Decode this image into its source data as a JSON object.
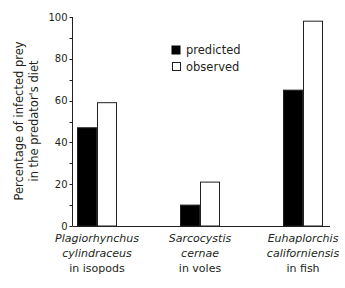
{
  "chart_data": {
    "type": "bar",
    "title": "",
    "xlabel": "",
    "ylabel": "Percentage of infected prey in the predator's diet",
    "ylabel_lines": [
      "Percentage of infected prey",
      "in the predator's diet"
    ],
    "ylim": [
      0,
      100
    ],
    "yticks": [
      0,
      20,
      40,
      60,
      80,
      100
    ],
    "grid": false,
    "legend_position": "upper center",
    "categories": [
      "Plagiorhynchus cylindraceus in isopods",
      "Sarcocystis cernae in voles",
      "Euhaplorchis californiensis in fish"
    ],
    "category_labels": [
      {
        "line1": "Plagiorhynchus",
        "line2": "cylindraceus",
        "line3": "in isopods"
      },
      {
        "line1": "Sarcocystis",
        "line2": "cernae",
        "line3": "in voles"
      },
      {
        "line1": "Euhaplorchis",
        "line2": "californiensis",
        "line3": "in fish"
      }
    ],
    "series": [
      {
        "name": "predicted",
        "color": "#000000",
        "values": [
          47,
          10,
          65
        ]
      },
      {
        "name": "observed",
        "color": "#ffffff",
        "values": [
          59,
          21,
          98
        ]
      }
    ]
  }
}
